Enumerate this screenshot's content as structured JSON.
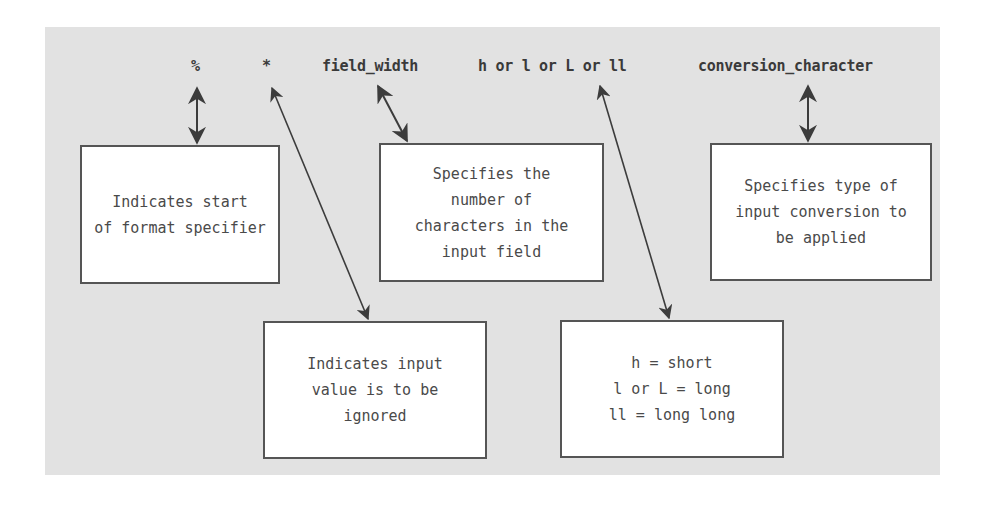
{
  "diagram": {
    "header_tokens": [
      {
        "id": "percent",
        "text": "%"
      },
      {
        "id": "asterisk",
        "text": "*"
      },
      {
        "id": "field-width",
        "text": "field_width"
      },
      {
        "id": "length-modifier",
        "text": "h or l or L or ll"
      },
      {
        "id": "conversion-character",
        "text": "conversion_character"
      }
    ],
    "boxes": [
      {
        "id": "start",
        "text": "Indicates start\nof format specifier"
      },
      {
        "id": "field-width",
        "text": "Specifies the\nnumber of\ncharacters in the\ninput field"
      },
      {
        "id": "conversion",
        "text": "Specifies type of\ninput conversion to\nbe applied"
      },
      {
        "id": "ignore",
        "text": "Indicates input\nvalue is to be\nignored"
      },
      {
        "id": "length",
        "text": "h = short\nl or L = long\nll = long long"
      }
    ],
    "colors": {
      "panel_background": "#e2e2e2",
      "box_background": "#ffffff",
      "box_border": "#555555",
      "arrow": "#3c3c3c",
      "text": "#3a3a3a"
    }
  }
}
